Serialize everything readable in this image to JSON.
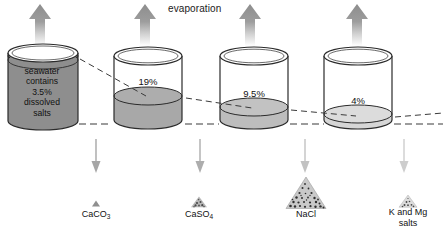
{
  "diagram": {
    "title_label": "evaporation",
    "seawater_caption": [
      "seawater",
      "contains",
      "3.5%",
      "dissolved",
      "salts"
    ],
    "stages": [
      {
        "id": "stage-1",
        "concentration_label": "",
        "liquid_color": "#8e8e8e",
        "fill_fraction": 0.92,
        "evaporation_arrow": "up-arrow-icon",
        "precipitate_arrow": "down-arrow-icon",
        "precipitate_label": "CaCO",
        "precipitate_subscript": "3",
        "precipitate_label_line2": "",
        "pile_size": 5
      },
      {
        "id": "stage-2",
        "concentration_label": "19%",
        "liquid_color": "#a8a8a8",
        "fill_fraction": 0.42,
        "evaporation_arrow": "up-arrow-icon",
        "precipitate_arrow": "down-arrow-icon",
        "precipitate_label": "CaSO",
        "precipitate_subscript": "4",
        "precipitate_label_line2": "",
        "pile_size": 10
      },
      {
        "id": "stage-3",
        "concentration_label": "9.5%",
        "liquid_color": "#bdbdbd",
        "fill_fraction": 0.26,
        "evaporation_arrow": "up-arrow-icon",
        "precipitate_arrow": "down-arrow-icon",
        "precipitate_label": "NaCl",
        "precipitate_subscript": "",
        "precipitate_label_line2": "",
        "pile_size": 30
      },
      {
        "id": "stage-4",
        "concentration_label": "4%",
        "liquid_color": "#d6d6d6",
        "fill_fraction": 0.14,
        "evaporation_arrow": "up-arrow-icon",
        "precipitate_arrow": "down-arrow-icon",
        "precipitate_label": "K and Mg",
        "precipitate_subscript": "",
        "precipitate_label_line2": "salts",
        "pile_size": 12
      }
    ],
    "colors": {
      "outline": "#2b2b2b",
      "arrow_up": "#9a9a9a",
      "arrow_down": "#b5b5b5",
      "dash": "#3a3a3a",
      "text": "#111111",
      "background": "#ffffff"
    }
  }
}
